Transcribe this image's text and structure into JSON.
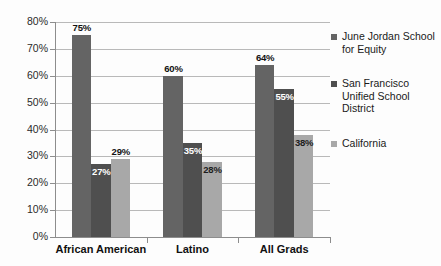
{
  "chart_data": {
    "type": "bar",
    "title": "",
    "subtitle": "",
    "xlabel": "",
    "ylabel": "",
    "categories": [
      "African American",
      "Latino",
      "All Grads"
    ],
    "series": [
      {
        "name": "June Jordan School for Equity",
        "color": "#646464",
        "values": [
          75,
          60,
          64
        ],
        "labels": [
          "75%",
          "60%",
          "64%"
        ]
      },
      {
        "name": "San Francisco Unified School District",
        "color": "#4f4f4f",
        "values": [
          27,
          35,
          55
        ],
        "labels": [
          "27%",
          "35%",
          "55%"
        ]
      },
      {
        "name": "California",
        "color": "#a8a8a8",
        "values": [
          29,
          28,
          38
        ],
        "labels": [
          "29%",
          "28%",
          "38%"
        ]
      }
    ],
    "ylim": [
      0,
      80
    ],
    "ytick_values": [
      0,
      10,
      20,
      30,
      40,
      50,
      60,
      70,
      80
    ],
    "ytick_labels": [
      "0%",
      "10%",
      "20%",
      "30%",
      "40%",
      "50%",
      "60%",
      "70%",
      "80%"
    ],
    "grid": true,
    "legend_position": "right",
    "value_format": "percent"
  },
  "legend": {
    "items": [
      {
        "label": "June Jordan School for Equity",
        "color": "#646464"
      },
      {
        "label": "San Francisco Unified School District",
        "color": "#4f4f4f"
      },
      {
        "label": "California",
        "color": "#a8a8a8"
      }
    ]
  }
}
